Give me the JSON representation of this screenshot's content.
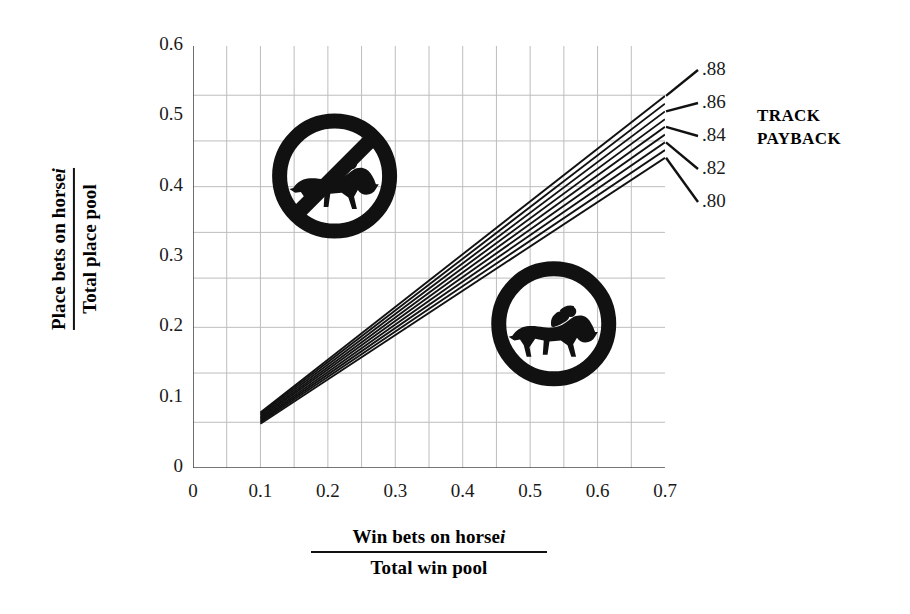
{
  "chart_data": {
    "type": "line",
    "title": "",
    "xlabel_numerator": "Win bets on horse",
    "xlabel_numerator_italic": "i",
    "xlabel_denominator": "Total win pool",
    "ylabel_numerator": "Place bets on horse",
    "ylabel_numerator_italic": "i",
    "ylabel_denominator": "Total place pool",
    "xlim": [
      0,
      0.7
    ],
    "ylim": [
      0,
      0.6
    ],
    "xticks": [
      "0",
      "0.1",
      "0.2",
      "0.3",
      "0.4",
      "0.5",
      "0.6",
      "0.7"
    ],
    "xtick_values": [
      0,
      0.1,
      0.2,
      0.3,
      0.4,
      0.5,
      0.6,
      0.7
    ],
    "yticks": [
      "0",
      "0.1",
      "0.2",
      "0.3",
      "0.4",
      "0.5",
      "0.6"
    ],
    "ytick_values": [
      0,
      0.1,
      0.2,
      0.3,
      0.4,
      0.5,
      0.6
    ],
    "grid": true,
    "grid_x_values": [
      0.05,
      0.1,
      0.15,
      0.2,
      0.25,
      0.3,
      0.35,
      0.4,
      0.45,
      0.5,
      0.55,
      0.6,
      0.65
    ],
    "grid_y_values": [
      0.065,
      0.135,
      0.2,
      0.27,
      0.335,
      0.4,
      0.465,
      0.53
    ],
    "legend_title": "TRACK PAYBACK",
    "legend_position": "right",
    "legend_labels": [
      ".88",
      ".86",
      ".84",
      ".82",
      ".80"
    ],
    "series": [
      {
        "name": ".88",
        "x": [
          0.1,
          0.7
        ],
        "values": [
          0.079,
          0.529
        ]
      },
      {
        "name": ".87",
        "x": [
          0.1,
          0.7
        ],
        "values": [
          0.077,
          0.518
        ]
      },
      {
        "name": ".86",
        "x": [
          0.1,
          0.7
        ],
        "values": [
          0.075,
          0.507
        ]
      },
      {
        "name": ".85",
        "x": [
          0.1,
          0.7
        ],
        "values": [
          0.073,
          0.496
        ]
      },
      {
        "name": ".84",
        "x": [
          0.1,
          0.7
        ],
        "values": [
          0.071,
          0.485
        ]
      },
      {
        "name": ".83",
        "x": [
          0.1,
          0.7
        ],
        "values": [
          0.069,
          0.474
        ]
      },
      {
        "name": ".82",
        "x": [
          0.1,
          0.7
        ],
        "values": [
          0.067,
          0.463
        ]
      },
      {
        "name": ".81",
        "x": [
          0.1,
          0.7
        ],
        "values": [
          0.065,
          0.452
        ]
      },
      {
        "name": ".80",
        "x": [
          0.1,
          0.7
        ],
        "values": [
          0.063,
          0.441
        ]
      }
    ],
    "annotations": [
      {
        "name": "no-horse-symbol",
        "meaning": "prohibited / unfavorable region",
        "x": 0.21,
        "y": 0.415
      },
      {
        "name": "horse-symbol",
        "meaning": "favorable region",
        "x": 0.535,
        "y": 0.205
      }
    ],
    "line_color": "#111111",
    "grid_color": "#bdbdbd",
    "axis_color": "#555555"
  }
}
